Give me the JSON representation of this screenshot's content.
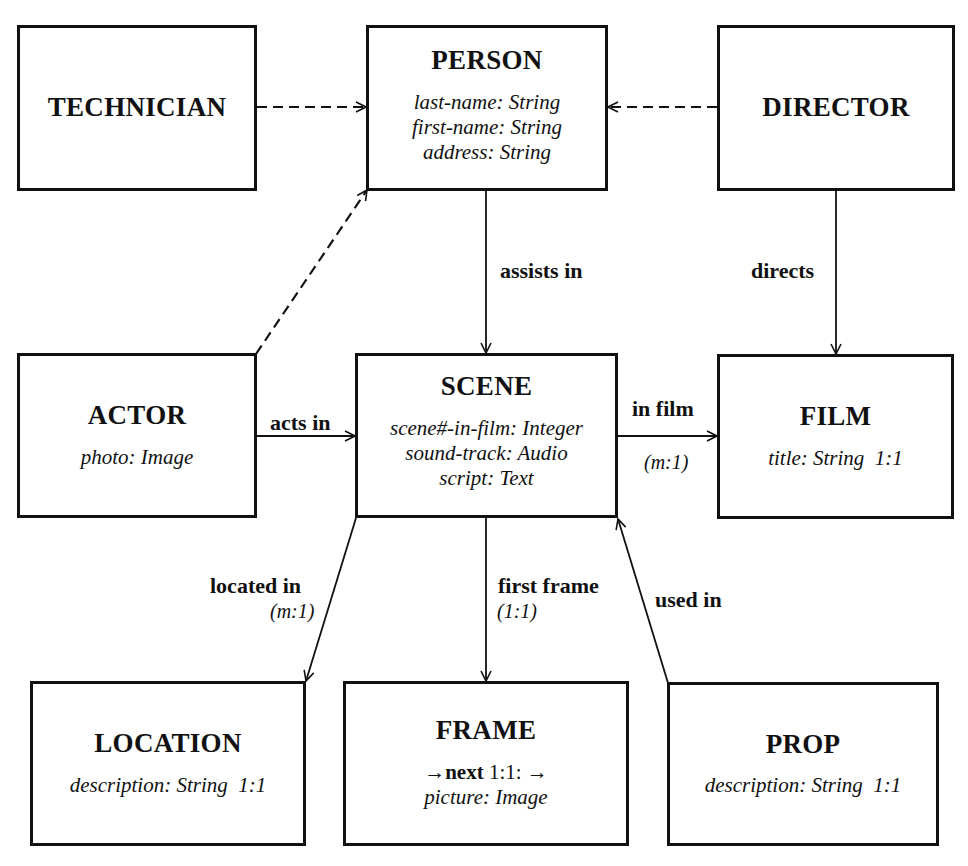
{
  "diagram": {
    "type": "entity-relationship",
    "entities": {
      "technician": {
        "name": "TECHNICIAN",
        "attributes": []
      },
      "person": {
        "name": "PERSON",
        "attributes": [
          "last-name: String",
          "first-name: String",
          "address: String"
        ]
      },
      "director": {
        "name": "DIRECTOR",
        "attributes": []
      },
      "actor": {
        "name": "ACTOR",
        "attributes": [
          "photo: Image"
        ]
      },
      "scene": {
        "name": "SCENE",
        "attributes": [
          "scene#-in-film: Integer",
          "sound-track: Audio",
          "script: Text"
        ]
      },
      "film": {
        "name": "FILM",
        "attributes": [
          "title: String  1:1"
        ]
      },
      "location": {
        "name": "LOCATION",
        "attributes": [
          "description: String  1:1"
        ]
      },
      "frame": {
        "name": "FRAME",
        "next_prefix": "→",
        "next_label": "next",
        "next_card": " 1:1: →",
        "attributes": [
          "picture: Image"
        ]
      },
      "prop": {
        "name": "PROP",
        "attributes": [
          "description: String  1:1"
        ]
      }
    },
    "relationships": {
      "technician_isa_person": {
        "from": "TECHNICIAN",
        "to": "PERSON",
        "style": "dashed"
      },
      "director_isa_person": {
        "from": "DIRECTOR",
        "to": "PERSON",
        "style": "dashed"
      },
      "actor_isa_person": {
        "from": "ACTOR",
        "to": "PERSON",
        "style": "dashed"
      },
      "assists_in": {
        "from": "PERSON",
        "to": "SCENE",
        "label": "assists in"
      },
      "directs": {
        "from": "DIRECTOR",
        "to": "FILM",
        "label": "directs"
      },
      "acts_in": {
        "from": "ACTOR",
        "to": "SCENE",
        "label": "acts in"
      },
      "in_film": {
        "from": "SCENE",
        "to": "FILM",
        "label": "in film",
        "cardinality": "(m:1)"
      },
      "located_in": {
        "from": "SCENE",
        "to": "LOCATION",
        "label": "located in",
        "cardinality": "(m:1)"
      },
      "first_frame": {
        "from": "SCENE",
        "to": "FRAME",
        "label": "first frame",
        "cardinality": "(1:1)"
      },
      "used_in": {
        "from": "PROP",
        "to": "SCENE",
        "label": "used in"
      }
    },
    "colors": {
      "ink": "#111111",
      "background": "#ffffff"
    }
  }
}
